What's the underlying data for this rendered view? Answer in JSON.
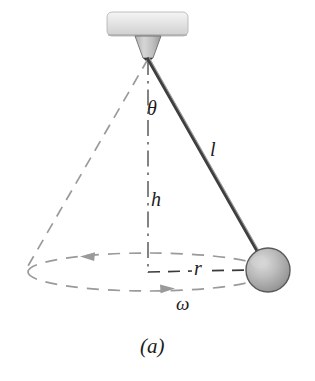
{
  "figure": {
    "caption": "(a)",
    "background_color": "#ffffff"
  },
  "labels": {
    "angle": "θ",
    "length": "l",
    "height": "h",
    "radius": "r",
    "angular_velocity": "ω"
  },
  "colors": {
    "rod": "#4a4a4a",
    "rod_highlight": "#9a9a9a",
    "dashed_gray": "#9a9a9a",
    "dashdot_axis": "#6e6e6e",
    "radius_dashed": "#3a3a3a",
    "ball_fill": "#b4b4b4",
    "ball_edge": "#555555",
    "ball_highlight": "#d8d8d8",
    "ceiling_fill": "#dcdcdc",
    "ceiling_edge": "#a8a8a8",
    "cone_fill": "#c8c8c8",
    "cone_edge": "#6a6a6a",
    "text": "#1c1c1c"
  },
  "geometry": {
    "pivot": {
      "x": 148,
      "y": 58
    },
    "bob_center": {
      "x": 268,
      "y": 270
    },
    "bob_radius": 22,
    "axis_bottom": {
      "x": 148,
      "y": 272
    },
    "cone_left_base": {
      "x": 28,
      "y": 266
    },
    "orbit_ellipse": {
      "cx": 148,
      "cy": 272,
      "rx": 120,
      "ry": 19
    },
    "ceiling_plate": {
      "x": 107,
      "y": 12,
      "width": 81,
      "height": 24
    },
    "pivot_cone": {
      "top_width": 26,
      "bottom_width": 10,
      "height": 22
    }
  },
  "annotations": {
    "orbit_direction_top": "arrow-left",
    "orbit_direction_bottom": "arrow-right",
    "radius_arrow": "arrow-right"
  }
}
